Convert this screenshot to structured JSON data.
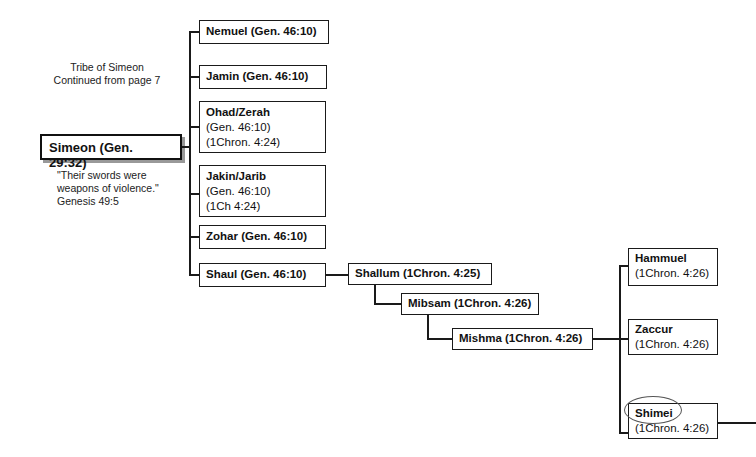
{
  "header": {
    "title_line1": "Tribe of Simeon",
    "title_line2": "Continued from page 7"
  },
  "root": {
    "label": "Simeon (Gen. 29:32)"
  },
  "quote": {
    "line1": "\"Their swords were",
    "line2": "weapons of violence.\"",
    "line3": "Genesis 49:5"
  },
  "sons": [
    {
      "name": "Nemuel (Gen. 46:10)"
    },
    {
      "name": "Jamin (Gen. 46:10)"
    },
    {
      "name": "Ohad/Zerah",
      "ref1": "(Gen. 46:10)",
      "ref2": "(1Chron. 4:24)"
    },
    {
      "name": "Jakin/Jarib",
      "ref1": "(Gen. 46:10)",
      "ref2": "(1Ch 4:24)"
    },
    {
      "name": "Zohar (Gen. 46:10)"
    },
    {
      "name": "Shaul (Gen. 46:10)"
    }
  ],
  "descendants": [
    {
      "name": "Shallum (1Chron. 4:25)"
    },
    {
      "name": "Mibsam (1Chron. 4:26)"
    },
    {
      "name": "Mishma (1Chron. 4:26)"
    }
  ],
  "mishma_sons": [
    {
      "name": "Hammuel",
      "ref": "(1Chron. 4:26)"
    },
    {
      "name": "Zaccur",
      "ref": "(1Chron. 4:26)"
    },
    {
      "name": "Shimei",
      "ref": "(1Chron. 4:26)",
      "circled": true
    }
  ]
}
